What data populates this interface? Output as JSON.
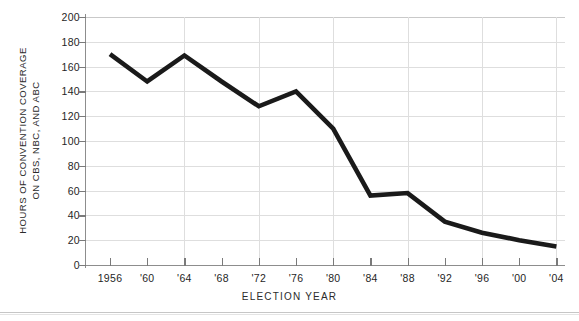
{
  "chart_data": {
    "type": "line",
    "title": "",
    "subtitle": "",
    "xlabel": "ELECTION  YEAR",
    "ylabel_line1": "HOURS OF CONVENTION COVERAGE",
    "ylabel_line2": "ON CBS, NBC, AND ABC",
    "categories": [
      "1956",
      "'60",
      "'64",
      "'68",
      "'72",
      "'76",
      "'80",
      "'84",
      "'88",
      "'92",
      "'96",
      "'00",
      "'04"
    ],
    "x_values": [
      1956,
      1960,
      1964,
      1968,
      1972,
      1976,
      1980,
      1984,
      1988,
      1992,
      1996,
      2000,
      2004
    ],
    "values": [
      170,
      148,
      169,
      148,
      128,
      140,
      110,
      56,
      58,
      35,
      26,
      20,
      15
    ],
    "series": [
      {
        "name": "Hours of convention coverage on CBS, NBC, and ABC",
        "values": [
          170,
          148,
          169,
          148,
          128,
          140,
          110,
          56,
          58,
          35,
          26,
          20,
          15
        ]
      }
    ],
    "ylim": [
      0,
      200
    ],
    "ytick_labels": [
      "200",
      "180",
      "160",
      "140",
      "120",
      "100",
      "80",
      "60",
      "40",
      "20",
      "0"
    ],
    "ytick_values": [
      200,
      180,
      160,
      140,
      120,
      100,
      80,
      60,
      40,
      20,
      0
    ],
    "grid": "both",
    "legend": "none",
    "line_color": "#1a1a1a",
    "grid_color": "#dedede",
    "axis_color": "#8d8d8d",
    "background_color": "#ffffff"
  }
}
